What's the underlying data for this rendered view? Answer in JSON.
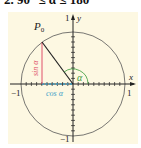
{
  "title": "2. 90° ≤ α ≤ 180°",
  "diagram": {
    "type": "unit-circle",
    "point_label": "P",
    "point_subscript": "0",
    "angle_label": "α",
    "sin_label": "sin α",
    "cos_label": "cos α",
    "x_axis_label": "x",
    "y_axis_label": "y",
    "tick_labels": {
      "x_neg": "−1",
      "x_pos": "1",
      "y_pos": "1",
      "y_neg": "−1"
    },
    "angle_degrees": 143,
    "colors": {
      "background": "#fdf8e2",
      "circle": "#555555",
      "axes": "#222222",
      "radius": "#222222",
      "sin": "#e0506a",
      "cos": "#3aa0c8",
      "angle": "#3a9a3a"
    }
  }
}
